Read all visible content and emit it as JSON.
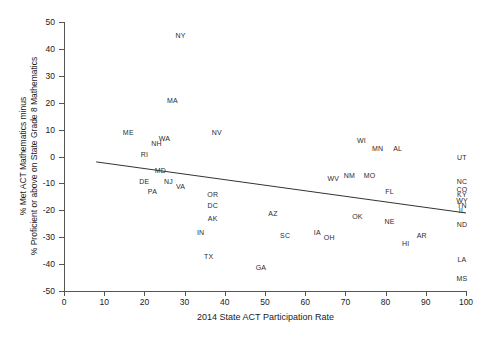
{
  "chart_data": {
    "type": "scatter",
    "title": "",
    "xlabel": "2014 State ACT Participation Rate",
    "ylabel_line1": "% Met ACT Mathematics minus",
    "ylabel_line2": "% Proficient or above on State Grade 8 Mathematics",
    "xlim": [
      0,
      100
    ],
    "ylim": [
      -50,
      50
    ],
    "xticks": [
      0,
      10,
      20,
      30,
      40,
      50,
      60,
      70,
      80,
      90,
      100
    ],
    "yticks": [
      -50,
      -40,
      -30,
      -20,
      -10,
      0,
      10,
      20,
      30,
      40,
      50
    ],
    "grid": false,
    "legend": "none",
    "marker_style": "text-label",
    "points": [
      {
        "label": "NY",
        "x": 29,
        "y": 45
      },
      {
        "label": "MA",
        "x": 27,
        "y": 21
      },
      {
        "label": "ME",
        "x": 16,
        "y": 9
      },
      {
        "label": "NV",
        "x": 38,
        "y": 9
      },
      {
        "label": "WA",
        "x": 25,
        "y": 7
      },
      {
        "label": "NH",
        "x": 23,
        "y": 5
      },
      {
        "label": "WI",
        "x": 74,
        "y": 6
      },
      {
        "label": "MN",
        "x": 78,
        "y": 3
      },
      {
        "label": "AL",
        "x": 83,
        "y": 3
      },
      {
        "label": "RI",
        "x": 20,
        "y": 1
      },
      {
        "label": "UT",
        "x": 99,
        "y": 0
      },
      {
        "label": "MD",
        "x": 24,
        "y": -5
      },
      {
        "label": "WV",
        "x": 67,
        "y": -8
      },
      {
        "label": "NM",
        "x": 71,
        "y": -7
      },
      {
        "label": "MO",
        "x": 76,
        "y": -7
      },
      {
        "label": "DE",
        "x": 20,
        "y": -9
      },
      {
        "label": "NJ",
        "x": 26,
        "y": -9
      },
      {
        "label": "VA",
        "x": 29,
        "y": -11
      },
      {
        "label": "NC",
        "x": 99,
        "y": -9
      },
      {
        "label": "PA",
        "x": 22,
        "y": -13
      },
      {
        "label": "OR",
        "x": 37,
        "y": -14
      },
      {
        "label": "FL",
        "x": 81,
        "y": -13
      },
      {
        "label": "CO",
        "x": 99,
        "y": -12
      },
      {
        "label": "KY",
        "x": 99,
        "y": -14
      },
      {
        "label": "WY",
        "x": 99,
        "y": -16
      },
      {
        "label": "TN",
        "x": 99,
        "y": -18
      },
      {
        "label": "IL",
        "x": 99,
        "y": -20
      },
      {
        "label": "DC",
        "x": 37,
        "y": -18
      },
      {
        "label": "AZ",
        "x": 52,
        "y": -21
      },
      {
        "label": "OK",
        "x": 73,
        "y": -22
      },
      {
        "label": "AK",
        "x": 37,
        "y": -23
      },
      {
        "label": "NE",
        "x": 81,
        "y": -24
      },
      {
        "label": "ND",
        "x": 99,
        "y": -25
      },
      {
        "label": "IN",
        "x": 34,
        "y": -28
      },
      {
        "label": "SC",
        "x": 55,
        "y": -29
      },
      {
        "label": "IA",
        "x": 63,
        "y": -28
      },
      {
        "label": "OH",
        "x": 66,
        "y": -30
      },
      {
        "label": "AR",
        "x": 89,
        "y": -29
      },
      {
        "label": "HI",
        "x": 85,
        "y": -32
      },
      {
        "label": "TX",
        "x": 36,
        "y": -37
      },
      {
        "label": "LA",
        "x": 99,
        "y": -38
      },
      {
        "label": "GA",
        "x": 49,
        "y": -41
      },
      {
        "label": "MS",
        "x": 99,
        "y": -45
      }
    ],
    "trendline": {
      "type": "linear-fit",
      "x_start": 8,
      "y_start": -2,
      "x_end": 100,
      "y_end": -21,
      "color": "#333333"
    }
  }
}
